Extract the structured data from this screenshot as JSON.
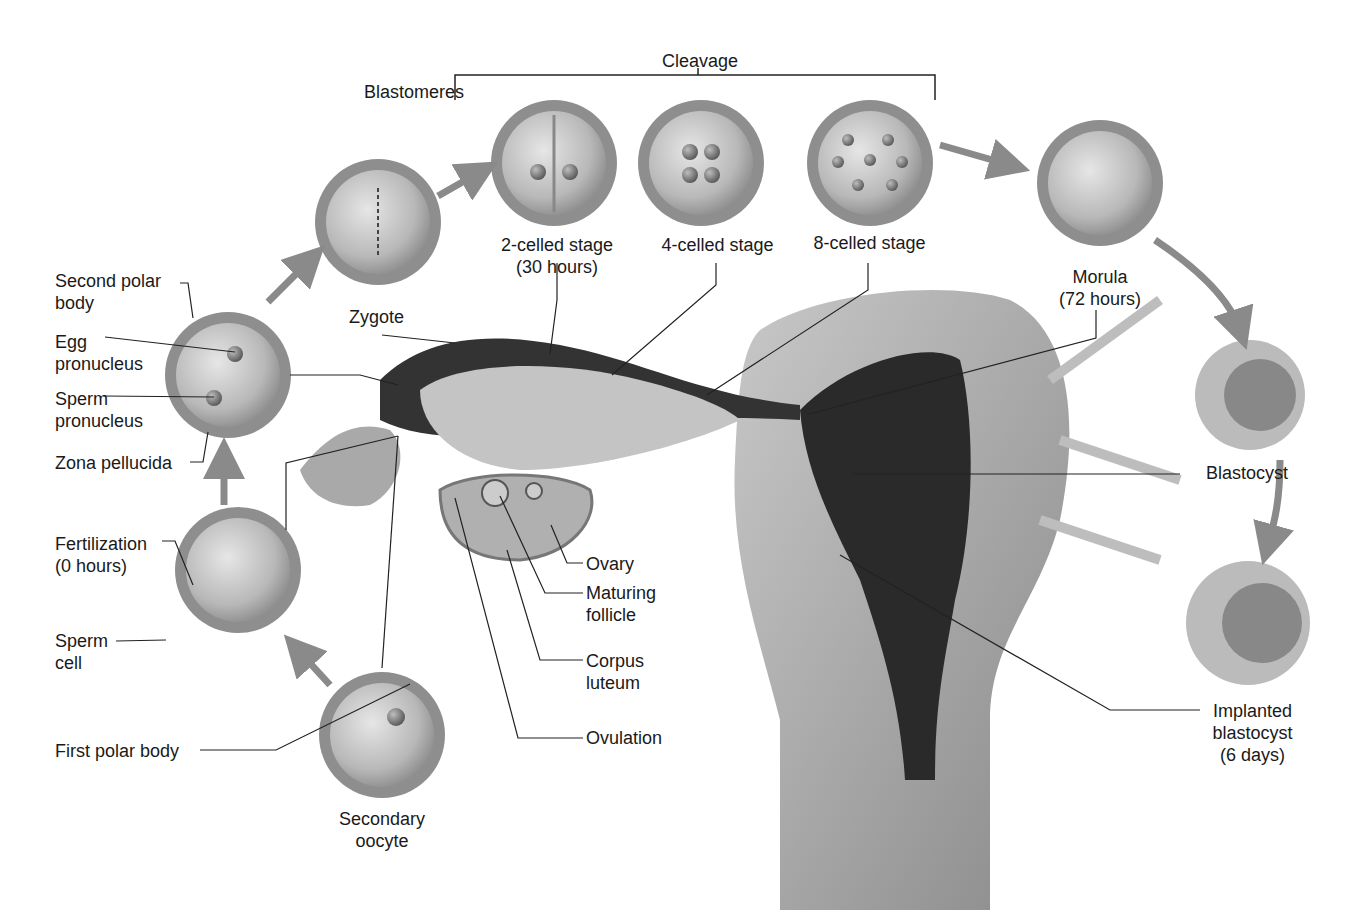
{
  "diagram": {
    "colors": {
      "background": "#ffffff",
      "cell": "#bdbdbd",
      "zona": "#8c8c8c",
      "tract": "#9a9a9a",
      "cavity": "#2a2a2a",
      "arrow": "#8a8a8a",
      "text": "#1a1a1a"
    },
    "labels": {
      "cleavage": "Cleavage",
      "blastomeres": "Blastomeres",
      "two_celled": "2-celled stage\n(30 hours)",
      "four_celled": "4-celled stage",
      "eight_celled": "8-celled stage",
      "morula": "Morula\n(72 hours)",
      "zygote": "Zygote",
      "second_polar_body": "Second polar\nbody",
      "egg_pronucleus": "Egg\npronucleus",
      "sperm_pronucleus": "Sperm\npronucleus",
      "zona_pellucida": "Zona pellucida",
      "fertilization": "Fertilization\n(0 hours)",
      "sperm_cell": "Sperm\ncell",
      "first_polar_body": "First polar body",
      "secondary_oocyte": "Secondary\noocyte",
      "ovary": "Ovary",
      "maturing_follicle": "Maturing\nfollicle",
      "corpus_luteum": "Corpus\nluteum",
      "ovulation": "Ovulation",
      "blastocyst": "Blastocyst",
      "implanted_blastocyst": "Implanted\nblastocyst\n(6 days)"
    }
  }
}
